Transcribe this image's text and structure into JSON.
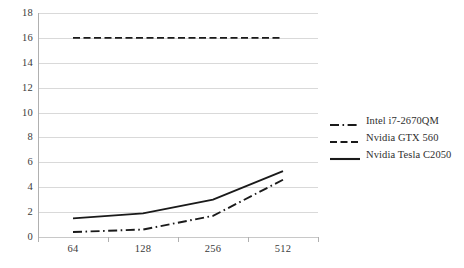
{
  "chart_data": {
    "type": "line",
    "title": "",
    "subtitle": "",
    "xlabel": "",
    "ylabel": "",
    "categories": [
      "64",
      "128",
      "256",
      "512"
    ],
    "ylim": [
      0,
      18
    ],
    "ytick_step": 2,
    "yticks": [
      "18",
      "16",
      "14",
      "12",
      "10",
      "8",
      "6",
      "4",
      "2",
      "0"
    ],
    "grid": true,
    "grid_orientation": "horizontal",
    "legend_position": "right",
    "series": [
      {
        "name": "Intel i7-2670QM",
        "style": "dash-dot",
        "color": "#1a1a1a",
        "values": [
          0.4,
          0.6,
          1.7,
          4.6
        ]
      },
      {
        "name": "Nvidia GTX 560",
        "style": "dashed",
        "color": "#1a1a1a",
        "values": [
          16.0,
          16.0,
          16.0,
          16.0
        ]
      },
      {
        "name": "Nvidia Tesla C2050",
        "style": "solid",
        "color": "#1a1a1a",
        "values": [
          1.5,
          1.9,
          3.0,
          5.3
        ]
      }
    ]
  },
  "legend": {
    "items": [
      {
        "label": "Intel i7-2670QM",
        "style": "dash-dot"
      },
      {
        "label": "Nvidia GTX 560",
        "style": "dashed"
      },
      {
        "label": "Nvidia Tesla C2050",
        "style": "solid"
      }
    ]
  },
  "colors": {
    "series_line": "#1a1a1a",
    "gridline": "#d9d9d9",
    "axis": "#b0b0b0",
    "tick_text": "#3a3a3a",
    "legend_text": "#2e2e2e",
    "background": "#ffffff"
  }
}
